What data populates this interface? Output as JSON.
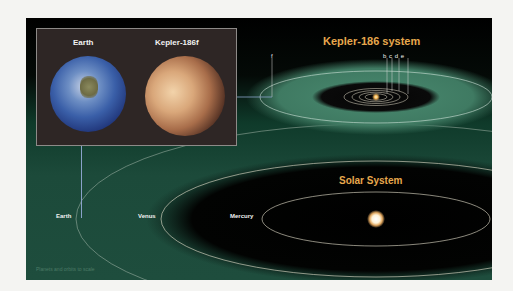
{
  "inset": {
    "earth_label": "Earth",
    "kepler_label": "Kepler-186f"
  },
  "kepler_system": {
    "title": "Kepler-186 system",
    "planets": [
      "b",
      "c",
      "d",
      "e",
      "f"
    ],
    "label_f": "f",
    "label_bcde": "b c d e"
  },
  "solar_system": {
    "title": "Solar System",
    "planets": {
      "earth": "Earth",
      "venus": "Venus",
      "mercury": "Mercury"
    }
  },
  "footnote": "Planets and orbits to scale",
  "colors": {
    "title_accent": "#e7a84d",
    "habitable_zone": "#3f7a62",
    "orbit_line": "#e8e2cf",
    "connector_line": "#8aa2c9"
  }
}
